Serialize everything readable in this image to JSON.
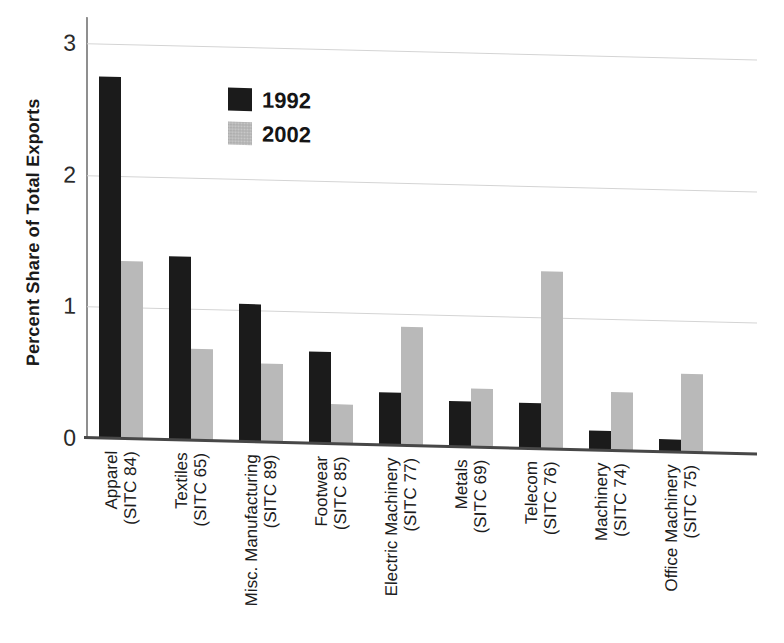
{
  "figure": {
    "background": "#ffffff",
    "ylabel": "Percent Share of Total Exports"
  },
  "chart_data": {
    "type": "bar",
    "title": "",
    "xlabel": "",
    "ylabel": "Percent Share of Total Exports",
    "ylim": [
      0,
      3.1
    ],
    "yticks": [
      0,
      1,
      2,
      3
    ],
    "grid": "horizontal",
    "legend_position": "top-left-inside",
    "categories": [
      {
        "name": "Apparel",
        "sitc": "(SITC 84)"
      },
      {
        "name": "Textiles",
        "sitc": "(SITC 65)"
      },
      {
        "name": "Misc. Manufacturing",
        "sitc": "(SITC 89)"
      },
      {
        "name": "Footwear",
        "sitc": "(SITC 85)"
      },
      {
        "name": "Electric Machinery",
        "sitc": "(SITC 77)"
      },
      {
        "name": "Metals",
        "sitc": "(SITC 69)"
      },
      {
        "name": "Telecom",
        "sitc": "(SITC 76)"
      },
      {
        "name": "Machinery",
        "sitc": "(SITC 74)"
      },
      {
        "name": "Office Machinery",
        "sitc": "(SITC 75)"
      }
    ],
    "series": [
      {
        "name": "1992",
        "color": "#1b1b1b",
        "values": [
          2.75,
          1.4,
          1.05,
          0.7,
          0.4,
          0.35,
          0.35,
          0.15,
          0.1
        ]
      },
      {
        "name": "2002",
        "color": "#b9b9b9",
        "values": [
          1.35,
          0.7,
          0.6,
          0.3,
          0.9,
          0.45,
          1.35,
          0.45,
          0.6
        ]
      }
    ]
  }
}
